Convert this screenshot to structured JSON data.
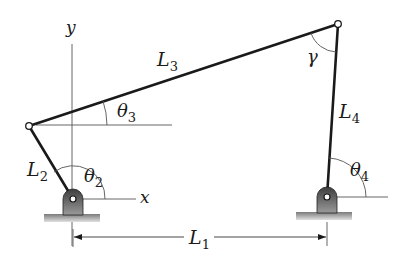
{
  "diagram": {
    "type": "four-bar linkage",
    "colors": {
      "link": "#1a1a1a",
      "thin_line": "#444444",
      "pivot_fill_dark": "#4a4a4a",
      "pivot_fill_light": "#9a9a9a",
      "ground_top": "#8a8a8a",
      "ground_bottom": "#d8d8d8"
    },
    "axes": {
      "y_label": "y",
      "x_label": "x"
    },
    "links": [
      {
        "name": "L",
        "sub": "1",
        "role": "ground link"
      },
      {
        "name": "L",
        "sub": "2",
        "role": "input crank"
      },
      {
        "name": "L",
        "sub": "3",
        "role": "coupler"
      },
      {
        "name": "L",
        "sub": "4",
        "role": "output rocker"
      }
    ],
    "angles": [
      {
        "symbol": "θ",
        "sub": "2"
      },
      {
        "symbol": "θ",
        "sub": "3"
      },
      {
        "symbol": "θ",
        "sub": "4"
      },
      {
        "symbol": "γ",
        "sub": ""
      }
    ]
  }
}
